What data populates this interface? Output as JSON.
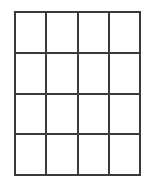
{
  "canvas": {
    "width": 141,
    "height": 176,
    "background_color": "#ffffff"
  },
  "grid": {
    "name": "empty-4x4-grid",
    "columns": 4,
    "rows": 4,
    "cell_count": 16,
    "line_color": "#3a3a3a",
    "line_width_px": 2,
    "cell_fill_color": "#ffffff",
    "bounds": {
      "left": 14,
      "top": 11,
      "right": 131,
      "bottom": 166,
      "width": 117,
      "height": 155
    },
    "vertical_line_positions": [
      14,
      43,
      72,
      102,
      131
    ],
    "horizontal_line_positions": [
      11,
      49,
      87,
      126,
      166
    ],
    "cell_width": 29.25,
    "cell_height": 38.75,
    "cells": [
      [
        "",
        "",
        "",
        ""
      ],
      [
        "",
        "",
        "",
        ""
      ],
      [
        "",
        "",
        "",
        ""
      ],
      [
        "",
        "",
        "",
        ""
      ]
    ]
  }
}
